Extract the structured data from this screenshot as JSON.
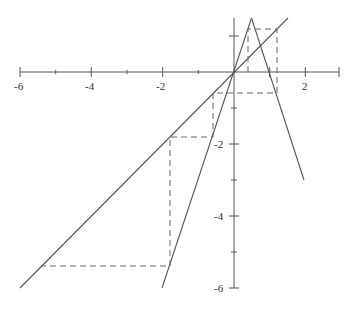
{
  "diagram": {
    "type": "cobweb-plot",
    "x_axis": {
      "range": [
        -6,
        2.95
      ],
      "tick_labels": [
        "-6",
        "-4",
        "-2",
        "2"
      ],
      "tick_values": [
        -6,
        -4,
        -2,
        2
      ],
      "minor_ticks": [
        -5,
        -3,
        -1,
        1
      ]
    },
    "y_axis": {
      "range": [
        -6,
        1.5
      ],
      "tick_labels": [
        "-2",
        "-4",
        "-6"
      ],
      "tick_values": [
        -2,
        -4,
        -6
      ],
      "minor_ticks": [
        1,
        -1,
        -3,
        -5
      ]
    },
    "curves": [
      {
        "name": "identity-line",
        "equation": "y = x",
        "from": [
          -6,
          -6
        ],
        "to": [
          1.5,
          1.5
        ]
      },
      {
        "name": "tent-left-leg",
        "equation": "y = 3x",
        "from": [
          -2,
          -6
        ],
        "to": [
          0.5,
          1.5
        ]
      },
      {
        "name": "tent-right-leg",
        "equation": "y = 3 - 3x",
        "from": [
          0.5,
          1.5
        ],
        "to": [
          2,
          -3
        ]
      }
    ],
    "cobweb_path": [
      [
        0.4,
        0
      ],
      [
        0.4,
        1.2
      ],
      [
        1.2,
        1.2
      ],
      [
        1.2,
        -0.6
      ],
      [
        -0.6,
        -0.6
      ],
      [
        -0.6,
        -1.8
      ],
      [
        -1.8,
        -1.8
      ],
      [
        -1.8,
        -5.4
      ],
      [
        -5.4,
        -5.4
      ]
    ]
  }
}
